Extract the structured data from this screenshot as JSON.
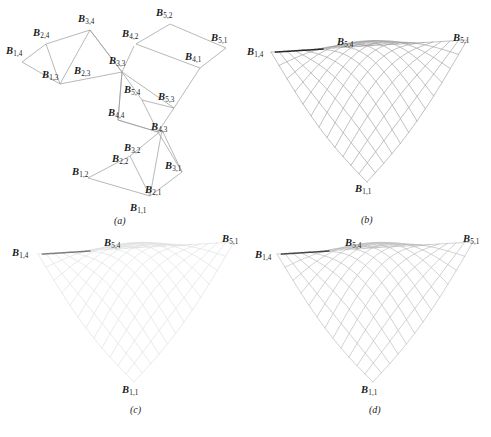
{
  "figure": {
    "domain": "bezier-control-net-and-surfaces",
    "background": "#ffffff",
    "ink_color": "#1b1b1b",
    "line_color": "#9a9a9a"
  },
  "panels": [
    {
      "id": "a",
      "caption": "(a)",
      "kind": "control-net-diagram",
      "description": "Bezier control point net drawn as four connected quadrilateral cells",
      "labels": [
        {
          "text": "B",
          "sub": "3,4",
          "x": 78,
          "y": 20
        },
        {
          "text": "B",
          "sub": "2,4",
          "x": 33,
          "y": 33
        },
        {
          "text": "B",
          "sub": "1,4",
          "x": 8,
          "y": 52
        },
        {
          "text": "B",
          "sub": "1,3",
          "x": 44,
          "y": 76
        },
        {
          "text": "B",
          "sub": "2,3",
          "x": 74,
          "y": 72
        },
        {
          "text": "B",
          "sub": "3,3",
          "x": 110,
          "y": 62
        },
        {
          "text": "B",
          "sub": "5,2",
          "x": 158,
          "y": 13
        },
        {
          "text": "B",
          "sub": "4,2",
          "x": 124,
          "y": 34
        },
        {
          "text": "B",
          "sub": "5,1",
          "x": 212,
          "y": 38
        },
        {
          "text": "B",
          "sub": "4,1",
          "x": 186,
          "y": 58
        },
        {
          "text": "B",
          "sub": "5,4",
          "x": 124,
          "y": 90
        },
        {
          "text": "B",
          "sub": "5,3",
          "x": 159,
          "y": 97
        },
        {
          "text": "B",
          "sub": "4,4",
          "x": 110,
          "y": 113
        },
        {
          "text": "B",
          "sub": "4,3",
          "x": 152,
          "y": 127
        },
        {
          "text": "B",
          "sub": "3,2",
          "x": 124,
          "y": 148
        },
        {
          "text": "B",
          "sub": "2,2",
          "x": 113,
          "y": 159
        },
        {
          "text": "B",
          "sub": "3,1",
          "x": 166,
          "y": 166
        },
        {
          "text": "B",
          "sub": "1,2",
          "x": 74,
          "y": 172
        },
        {
          "text": "B",
          "sub": "2,1",
          "x": 146,
          "y": 190
        },
        {
          "text": "B",
          "sub": "1,1",
          "x": 131,
          "y": 208
        }
      ],
      "caption_pos": {
        "x": 114,
        "y": 218
      }
    },
    {
      "id": "b",
      "caption": "(b)",
      "kind": "surface-mesh",
      "description": "Rendered saddle surface with dense quad mesh, darkest rendering",
      "mesh_opacity": 0.85,
      "labels": [
        {
          "text": "B",
          "sub": "1,4",
          "x": 2,
          "y": 53
        },
        {
          "text": "B",
          "sub": "5,4",
          "x": 92,
          "y": 42
        },
        {
          "text": "B",
          "sub": "5,1",
          "x": 208,
          "y": 38
        },
        {
          "text": "B",
          "sub": "1,1",
          "x": 110,
          "y": 189
        }
      ],
      "caption_pos": {
        "x": 116,
        "y": 217
      }
    },
    {
      "id": "c",
      "caption": "(c)",
      "kind": "surface-mesh",
      "description": "Same saddle surface, lighter / fainter mesh rendering",
      "mesh_opacity": 0.42,
      "labels": [
        {
          "text": "B",
          "sub": "1,4",
          "x": 12,
          "y": 24
        },
        {
          "text": "B",
          "sub": "5,4",
          "x": 104,
          "y": 14
        },
        {
          "text": "B",
          "sub": "5,1",
          "x": 222,
          "y": 10
        },
        {
          "text": "B",
          "sub": "1,1",
          "x": 122,
          "y": 160
        }
      ],
      "caption_pos": {
        "x": 130,
        "y": 180
      }
    },
    {
      "id": "d",
      "caption": "(d)",
      "kind": "surface-mesh",
      "description": "Same saddle surface, medium mesh rendering",
      "mesh_opacity": 0.68,
      "labels": [
        {
          "text": "B",
          "sub": "1,4",
          "x": 10,
          "y": 26
        },
        {
          "text": "B",
          "sub": "5,4",
          "x": 100,
          "y": 14
        },
        {
          "text": "B",
          "sub": "5,1",
          "x": 218,
          "y": 10
        },
        {
          "text": "B",
          "sub": "1,1",
          "x": 116,
          "y": 160
        }
      ],
      "caption_pos": {
        "x": 124,
        "y": 180
      }
    }
  ],
  "control_net": {
    "cells": [
      {
        "name": "upper-left-cell",
        "corners": [
          [
            90,
            30
          ],
          [
            46,
            44
          ],
          [
            22,
            62
          ],
          [
            60,
            84
          ],
          [
            122,
            72
          ]
        ],
        "polyline": [
          [
            22,
            62
          ],
          [
            46,
            44
          ],
          [
            90,
            30
          ],
          [
            122,
            72
          ],
          [
            60,
            84
          ],
          [
            22,
            62
          ]
        ]
      },
      {
        "name": "upper-right-cell",
        "corners": [
          [
            170,
            24
          ],
          [
            136,
            44
          ],
          [
            200,
            68
          ],
          [
            226,
            48
          ]
        ],
        "polyline": [
          [
            136,
            44
          ],
          [
            170,
            24
          ],
          [
            226,
            48
          ],
          [
            200,
            68
          ],
          [
            136,
            44
          ]
        ]
      },
      {
        "name": "middle-cell",
        "corners": [
          [
            122,
            72
          ],
          [
            136,
            100
          ],
          [
            170,
            108
          ],
          [
            124,
            124
          ],
          [
            112,
            124
          ]
        ],
        "polyline": [
          [
            122,
            72
          ],
          [
            140,
            100
          ],
          [
            172,
            108
          ],
          [
            160,
            130
          ],
          [
            118,
            122
          ],
          [
            122,
            72
          ]
        ]
      },
      {
        "name": "lower-cell",
        "corners": [
          [
            160,
            130
          ],
          [
            128,
            158
          ],
          [
            88,
            178
          ],
          [
            152,
            198
          ],
          [
            180,
            172
          ]
        ],
        "polyline": [
          [
            88,
            178
          ],
          [
            128,
            158
          ],
          [
            160,
            130
          ],
          [
            180,
            172
          ],
          [
            152,
            198
          ],
          [
            88,
            178
          ]
        ]
      }
    ],
    "connectors": [
      [
        [
          90,
          30
        ],
        [
          122,
          72
        ]
      ],
      [
        [
          122,
          72
        ],
        [
          118,
          122
        ]
      ],
      [
        [
          118,
          122
        ],
        [
          160,
          130
        ]
      ],
      [
        [
          160,
          130
        ],
        [
          180,
          172
        ]
      ]
    ]
  },
  "surface": {
    "type": "bicubic-bezier-saddle",
    "u_divisions": 16,
    "v_divisions": 16,
    "corners_named": [
      "B1,1",
      "B1,4",
      "B5,1",
      "B5,4"
    ],
    "highlight_curve": "dark ridge along the B5,4 crease"
  }
}
